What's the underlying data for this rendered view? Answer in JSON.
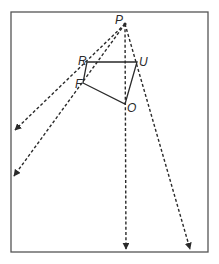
{
  "diagram": {
    "frame": {
      "x": 11,
      "y": 12,
      "width": 197,
      "height": 240,
      "stroke": "#555555"
    },
    "colors": {
      "line": "#2a2a2a",
      "frame": "#555555"
    },
    "source_point": {
      "label": "P",
      "x": 125,
      "y": 24
    },
    "points": [
      {
        "label": "R",
        "x": 87,
        "y": 62
      },
      {
        "label": "U",
        "x": 137,
        "y": 62
      },
      {
        "label": "F",
        "x": 83,
        "y": 83
      },
      {
        "label": "O",
        "x": 125,
        "y": 104
      }
    ],
    "labels": {
      "P": {
        "text": "P",
        "x": 115,
        "y": 24
      },
      "R": {
        "text": "R",
        "x": 78,
        "y": 65
      },
      "U": {
        "text": "U",
        "x": 139,
        "y": 66
      },
      "F": {
        "text": "F",
        "x": 75,
        "y": 88
      },
      "O": {
        "text": "O",
        "x": 127,
        "y": 112
      }
    },
    "polygon": [
      "R",
      "U",
      "O",
      "F"
    ],
    "rays": [
      {
        "name": "ray-through-R",
        "from": "P",
        "end": {
          "x": 15,
          "y": 130
        }
      },
      {
        "name": "ray-through-F",
        "from": "P",
        "end": {
          "x": 14,
          "y": 176
        }
      },
      {
        "name": "ray-through-O",
        "from": "P",
        "end": {
          "x": 126,
          "y": 249
        }
      },
      {
        "name": "ray-through-U",
        "from": "P",
        "end": {
          "x": 190,
          "y": 249
        }
      }
    ]
  }
}
